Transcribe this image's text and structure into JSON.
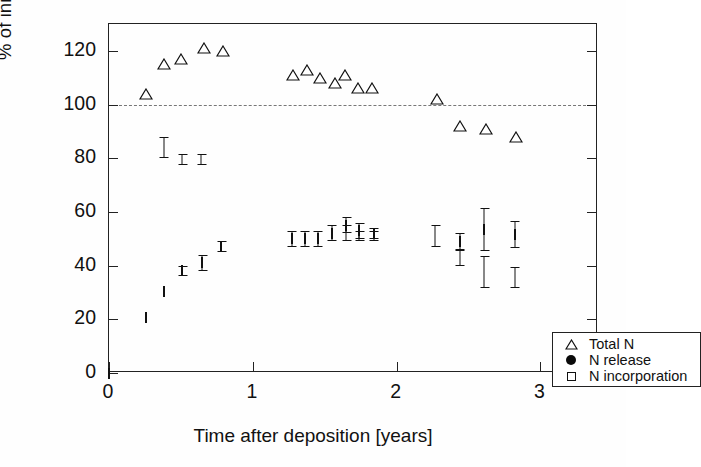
{
  "chart_data": {
    "type": "scatter",
    "title": "",
    "xlabel": "Time after deposition [years]",
    "ylabel": "% of initial litter N",
    "xlim": [
      0,
      3.4
    ],
    "ylim": [
      0,
      130
    ],
    "xticks": [
      0,
      1,
      2,
      3
    ],
    "xtick_labels": [
      "0",
      "1",
      "2",
      "3"
    ],
    "yticks": [
      0,
      20,
      40,
      60,
      80,
      100,
      120
    ],
    "ytick_labels": [
      "0",
      "20",
      "40",
      "60",
      "80",
      "100",
      "120"
    ],
    "grid": false,
    "reference_line": {
      "y": 100,
      "style": "dashed",
      "color": "#777777"
    },
    "legend_position": "bottom-right",
    "series": [
      {
        "name": "Total N",
        "marker": "open-triangle",
        "color": "#111111",
        "points": [
          {
            "x": 0.26,
            "y": 104
          },
          {
            "x": 0.38,
            "y": 115
          },
          {
            "x": 0.5,
            "y": 117
          },
          {
            "x": 0.66,
            "y": 121
          },
          {
            "x": 0.79,
            "y": 120
          },
          {
            "x": 1.28,
            "y": 111
          },
          {
            "x": 1.38,
            "y": 113
          },
          {
            "x": 1.47,
            "y": 110
          },
          {
            "x": 1.57,
            "y": 108
          },
          {
            "x": 1.64,
            "y": 111
          },
          {
            "x": 1.73,
            "y": 106
          },
          {
            "x": 1.83,
            "y": 106
          },
          {
            "x": 2.28,
            "y": 102
          },
          {
            "x": 2.44,
            "y": 92
          },
          {
            "x": 2.62,
            "y": 91
          },
          {
            "x": 2.83,
            "y": 88
          }
        ]
      },
      {
        "name": "N release",
        "marker": "filled-circle",
        "color": "#0a0a0a",
        "points": [
          {
            "x": 0.25,
            "y": 84.5,
            "err": 0
          },
          {
            "x": 0.38,
            "y": 84,
            "err": 4
          },
          {
            "x": 0.51,
            "y": 79.5,
            "err": 2
          },
          {
            "x": 0.64,
            "y": 79.5,
            "err": 2
          },
          {
            "x": 0.78,
            "y": 72,
            "err": 0
          },
          {
            "x": 1.28,
            "y": 62.5,
            "err": 0
          },
          {
            "x": 1.38,
            "y": 63,
            "err": 0
          },
          {
            "x": 1.47,
            "y": 59,
            "err": 0
          },
          {
            "x": 1.57,
            "y": 56,
            "err": 0
          },
          {
            "x": 1.65,
            "y": 52,
            "err": 3
          },
          {
            "x": 1.74,
            "y": 51,
            "err": 2
          },
          {
            "x": 1.84,
            "y": 51,
            "err": 2
          },
          {
            "x": 2.27,
            "y": 51,
            "err": 4
          },
          {
            "x": 2.44,
            "y": 43,
            "err": 3
          },
          {
            "x": 2.61,
            "y": 37.5,
            "err": 6
          },
          {
            "x": 2.82,
            "y": 35.5,
            "err": 4
          }
        ]
      },
      {
        "name": "N incorporation",
        "marker": "open-square",
        "color": "#111111",
        "points": [
          {
            "x": 0.0,
            "y": 0,
            "err": 0
          },
          {
            "x": 0.26,
            "y": 20.5,
            "err": 0
          },
          {
            "x": 0.38,
            "y": 30.5,
            "err": 0
          },
          {
            "x": 0.51,
            "y": 38,
            "err": 2
          },
          {
            "x": 0.65,
            "y": 41,
            "err": 3
          },
          {
            "x": 0.78,
            "y": 47,
            "err": 2
          },
          {
            "x": 1.27,
            "y": 50,
            "err": 3
          },
          {
            "x": 1.36,
            "y": 50,
            "err": 3
          },
          {
            "x": 1.45,
            "y": 50,
            "err": 3
          },
          {
            "x": 1.55,
            "y": 52,
            "err": 3
          },
          {
            "x": 1.65,
            "y": 55,
            "err": 3
          },
          {
            "x": 1.74,
            "y": 53,
            "err": 3
          },
          {
            "x": 1.84,
            "y": 52,
            "err": 2
          },
          {
            "x": 2.44,
            "y": 49,
            "err": 3
          },
          {
            "x": 2.61,
            "y": 53.5,
            "err": 8
          },
          {
            "x": 2.82,
            "y": 51.5,
            "err": 5
          }
        ]
      }
    ],
    "legend": [
      {
        "label": "Total N",
        "marker": "open-triangle"
      },
      {
        "label": "N release",
        "marker": "filled-circle"
      },
      {
        "label": "N incorporation",
        "marker": "open-square"
      }
    ]
  }
}
